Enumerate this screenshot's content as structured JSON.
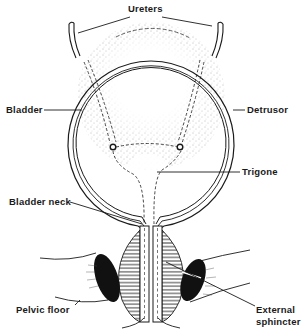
{
  "diagram": {
    "type": "anatomical-illustration",
    "colors": {
      "ink": "#1a1a1a",
      "background": "#ffffff",
      "stipple": "#6a6a6a",
      "muscle_fill": "#111111"
    },
    "labels": {
      "ureters": "Ureters",
      "bladder": "Bladder",
      "detrusor": "Detrusor",
      "trigone": "Trigone",
      "bladder_neck": "Bladder neck",
      "pelvic_floor": "Pelvic floor",
      "external_sphincter_line1": "External",
      "external_sphincter_line2": "sphincter"
    }
  }
}
